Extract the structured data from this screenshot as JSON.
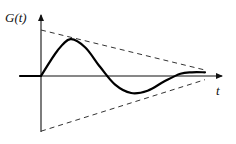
{
  "figure": {
    "y_axis_label": "G(t)",
    "x_axis_label": "t",
    "colors": {
      "curve": "#000000",
      "envelope": "#333333",
      "axis": "#111111",
      "background": "#ffffff"
    },
    "curve_shape": {
      "samples_t": [
        0.0,
        0.1,
        0.18,
        0.27,
        0.36,
        0.45,
        0.55,
        0.65,
        0.75,
        0.85,
        0.92,
        1.0
      ],
      "samples_G": [
        0.0,
        0.55,
        0.8,
        0.62,
        0.2,
        -0.18,
        -0.37,
        -0.32,
        -0.12,
        0.05,
        0.08,
        0.08
      ]
    },
    "envelope_upper": {
      "t_start": 0.0,
      "G_start": 1.0,
      "t_end": 1.0,
      "G_end": 0.13
    },
    "envelope_lower": {
      "t_start": 0.0,
      "G_start": -1.2,
      "t_end": 1.0,
      "G_end": -0.08
    }
  }
}
